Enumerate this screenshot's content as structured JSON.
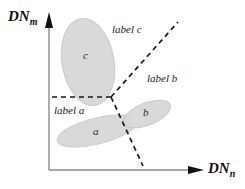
{
  "figure": {
    "type": "feature-space-decision-diagram",
    "background": "#ffffff",
    "axes": {
      "y_label_text": "DN",
      "y_label_sub": "m",
      "x_label_text": "DN",
      "x_label_sub": "n",
      "color": "#7a7a7a",
      "origin": [
        49,
        170
      ],
      "y_top": [
        49,
        17
      ],
      "x_right": [
        203,
        170
      ]
    },
    "clusters": [
      {
        "id": "c",
        "label": "c",
        "fill": "#d9d9d9",
        "stroke": "#c4c4c4",
        "cx": 88,
        "cy": 62,
        "rx": 26,
        "ry": 44,
        "rotate": -10,
        "label_x": 83,
        "label_y": 55
      },
      {
        "id": "a",
        "label": "a",
        "fill": "#d9d9d9",
        "stroke": "#c4c4c4",
        "cx": 97,
        "cy": 131,
        "rx": 41,
        "ry": 13,
        "rotate": -14,
        "label_x": 93,
        "label_y": 125
      },
      {
        "id": "b",
        "label": "b",
        "fill": "#d9d9d9",
        "stroke": "#c4c4c4",
        "cx": 147,
        "cy": 114,
        "rx": 25,
        "ry": 11,
        "rotate": -22,
        "label_x": 143,
        "label_y": 108
      }
    ],
    "boundaries": {
      "junction": [
        111,
        97
      ],
      "dash_color": "#1a1a1a",
      "dash_pattern": "5,4",
      "lines": [
        {
          "name": "horizontal-boundary",
          "x1": 52,
          "y1": 97,
          "x2": 111,
          "y2": 97
        },
        {
          "name": "upper-right-boundary",
          "x1": 111,
          "y1": 97,
          "x2": 178,
          "y2": 22
        },
        {
          "name": "lower-right-boundary",
          "x1": 111,
          "y1": 97,
          "x2": 143,
          "y2": 166
        }
      ]
    },
    "region_labels": [
      {
        "id": "label-c",
        "text": "label c",
        "x": 112,
        "y": 29
      },
      {
        "id": "label-b",
        "text": "label b",
        "x": 147,
        "y": 78
      },
      {
        "id": "label-a",
        "text": "label a",
        "x": 54,
        "y": 110
      }
    ]
  }
}
